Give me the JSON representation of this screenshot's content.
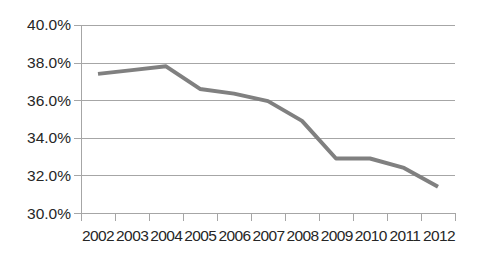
{
  "chart_data": {
    "type": "line",
    "title": "",
    "subtitle": "",
    "xlabel": "",
    "ylabel": "",
    "categories": [
      "2002",
      "2003",
      "2004",
      "2005",
      "2006",
      "2007",
      "2008",
      "2009",
      "2010",
      "2011",
      "2012"
    ],
    "series": [
      {
        "name": "",
        "color": "#808080",
        "values": [
          37.4,
          37.6,
          37.8,
          36.6,
          36.35,
          35.95,
          34.9,
          32.9,
          32.9,
          32.4,
          31.4
        ]
      }
    ],
    "ylim": [
      30.0,
      40.0
    ],
    "y_tick_values": [
      40.0,
      38.0,
      36.0,
      34.0,
      32.0,
      30.0
    ],
    "y_tick_labels": [
      "40.0%",
      "38.0%",
      "36.0%",
      "34.0%",
      "32.0%",
      "30.0%"
    ],
    "grid": true,
    "grid_axis": "y",
    "legend": false,
    "legend_position": "none",
    "markers": false
  },
  "style": {
    "grid_color": "#a6a6a6",
    "axis_color": "#a6a6a6",
    "text_color": "#262626",
    "series_color": "#808080",
    "background": "#ffffff"
  }
}
